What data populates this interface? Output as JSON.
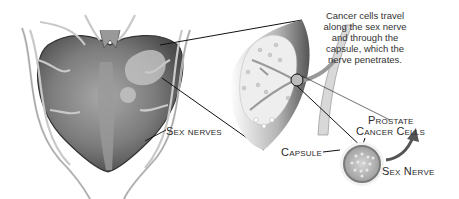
{
  "diagram": {
    "caption": "Cancer cells travel along the sex nerve and through the capsule, which the nerve penetrates.",
    "labels": {
      "sex_nerves": "Sex nerves",
      "capsule": "Capsule",
      "prostate_cancer_cells_line1": "Prostate",
      "prostate_cancer_cells_line2": "Cancer Cells",
      "sex_nerve": "Sex Nerve"
    },
    "colors": {
      "gland_dark": "#555555",
      "gland_mid": "#8a8a8a",
      "nerve": "#d4d4d4",
      "tumor": "#e6e6e6"
    }
  }
}
